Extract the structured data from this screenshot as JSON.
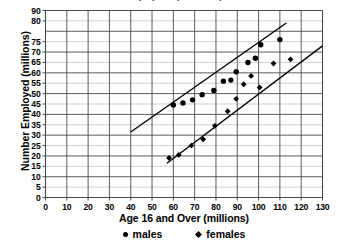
{
  "chart_data": {
    "type": "scatter",
    "title": "Employment (in millions)",
    "xlabel": "Age 16 and Over (millions)",
    "ylabel": "Number Employed (millions)",
    "xlim": [
      0,
      130
    ],
    "ylim": [
      0,
      90
    ],
    "xticks": [
      0,
      10,
      20,
      30,
      40,
      50,
      60,
      70,
      80,
      90,
      100,
      110,
      120,
      130
    ],
    "xtick_labels": [
      "0",
      "10",
      "20",
      "30",
      "40",
      "50",
      "60",
      "70",
      "80",
      "90",
      "100",
      "110",
      "120",
      "130"
    ],
    "yticks": [
      0,
      5,
      10,
      15,
      20,
      25,
      30,
      35,
      40,
      45,
      50,
      55,
      60,
      65,
      70,
      75,
      85,
      90
    ],
    "ytick_labels": [
      "0",
      "5",
      "10",
      "15",
      "20",
      "25",
      "30",
      "35",
      "40",
      "45",
      "50",
      "55",
      "60",
      "65",
      "70",
      "75",
      "80",
      "90"
    ],
    "grid": true,
    "legend_position": "bottom",
    "series": [
      {
        "name": "males",
        "marker": "circle",
        "color": "#000000",
        "points": [
          [
            60.0,
            44.5
          ],
          [
            64.5,
            45.5
          ],
          [
            69.0,
            47.0
          ],
          [
            73.5,
            49.5
          ],
          [
            79.0,
            51.5
          ],
          [
            83.5,
            56.0
          ],
          [
            87.0,
            56.5
          ],
          [
            89.5,
            60.5
          ],
          [
            95.0,
            65.0
          ],
          [
            98.5,
            67.0
          ],
          [
            101.0,
            73.5
          ],
          [
            110.0,
            76.0
          ]
        ],
        "trendline": {
          "x": [
            40,
            113
          ],
          "y": [
            31.5,
            84.0
          ]
        }
      },
      {
        "name": "females",
        "marker": "diamond",
        "color": "#000000",
        "points": [
          [
            58.0,
            19.0
          ],
          [
            62.5,
            20.5
          ],
          [
            68.5,
            25.0
          ],
          [
            74.0,
            28.0
          ],
          [
            79.5,
            34.5
          ],
          [
            85.5,
            41.5
          ],
          [
            89.5,
            47.5
          ],
          [
            93.0,
            54.5
          ],
          [
            96.5,
            58.5
          ],
          [
            100.5,
            53.0
          ],
          [
            107.0,
            64.5
          ],
          [
            115.0,
            66.5
          ]
        ],
        "trendline": {
          "x": [
            57,
            130
          ],
          "y": [
            16.5,
            73.0
          ]
        }
      }
    ],
    "legend": [
      {
        "label": "males",
        "marker": "circle"
      },
      {
        "label": "females",
        "marker": "diamond"
      }
    ]
  },
  "colors": {
    "major_grid": "#4a4a4a",
    "minor_grid": "#c9c9c9",
    "axis": "#4a4a4a",
    "marker": "#000000",
    "trendline": "#000000",
    "background": "#ffffff"
  }
}
